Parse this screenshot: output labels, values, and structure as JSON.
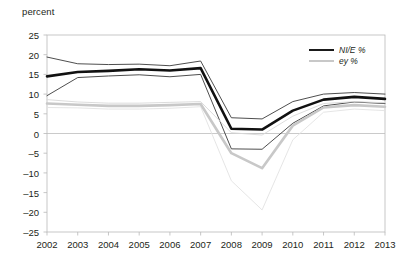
{
  "axis_title": "percent",
  "legend": {
    "position": "top-right",
    "entries": [
      {
        "label": "NI/E %",
        "color": "#1a1a1a",
        "width": 2.6,
        "name": "legend-item-nie"
      },
      {
        "label": "ey %",
        "color": "#c8c8c8",
        "width": 2.6,
        "name": "legend-item-ey"
      }
    ]
  },
  "chart_data": {
    "type": "line",
    "title": "",
    "subtitle": "",
    "xlabel": "",
    "ylabel": "percent",
    "grid": false,
    "zero_line": true,
    "xlim": [
      2002,
      2013
    ],
    "ylim": [
      -25,
      25
    ],
    "ytick_step": 5,
    "x": [
      2002,
      2003,
      2004,
      2005,
      2006,
      2007,
      2008,
      2009,
      2010,
      2011,
      2012,
      2013
    ],
    "categories": [
      "2002",
      "2003",
      "2004",
      "2005",
      "2006",
      "2007",
      "2008",
      "2009",
      "2010",
      "2011",
      "2012",
      "2013"
    ],
    "ytick_labels": [
      "25",
      "20",
      "15",
      "10",
      "5",
      "0",
      "-5",
      "-10",
      "-15",
      "-20",
      "-25"
    ],
    "series": [
      {
        "name": "NI/E %",
        "role": "central",
        "color": "#111111",
        "width": 2.6,
        "values": [
          14.5,
          15.6,
          15.9,
          16.3,
          16.0,
          16.6,
          1.2,
          1.0,
          5.8,
          8.6,
          9.3,
          8.8
        ]
      },
      {
        "name": "NI/E % upper band",
        "role": "band-upper",
        "color": "#3a3a3a",
        "width": 0.9,
        "values": [
          19.4,
          17.7,
          17.5,
          17.6,
          17.2,
          18.4,
          4.0,
          3.7,
          8.1,
          10.0,
          10.4,
          10.0
        ]
      },
      {
        "name": "NI/E % lower band",
        "role": "band-lower",
        "color": "#3a3a3a",
        "width": 0.9,
        "values": [
          9.6,
          14.2,
          14.6,
          14.9,
          14.4,
          15.0,
          -3.9,
          -4.0,
          2.6,
          7.0,
          8.0,
          7.6
        ]
      },
      {
        "name": "ey %",
        "role": "central",
        "color": "#c8c8c8",
        "width": 2.6,
        "values": [
          7.6,
          7.3,
          7.0,
          7.0,
          7.2,
          7.5,
          -5.0,
          -8.8,
          2.0,
          6.6,
          7.2,
          6.8
        ]
      },
      {
        "name": "ey % upper band",
        "role": "band-upper",
        "color": "#d8d8d8",
        "width": 0.9,
        "values": [
          8.6,
          8.0,
          7.7,
          7.7,
          7.9,
          8.1,
          0.2,
          -0.4,
          4.4,
          7.6,
          8.1,
          7.8
        ]
      },
      {
        "name": "ey % lower band",
        "role": "band-lower",
        "color": "#e2e2e2",
        "width": 0.9,
        "values": [
          6.6,
          6.5,
          6.2,
          6.2,
          6.4,
          6.8,
          -12.0,
          -19.4,
          -1.6,
          5.4,
          6.2,
          5.8
        ]
      }
    ]
  }
}
